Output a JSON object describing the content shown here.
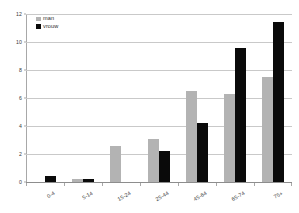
{
  "chart_data": {
    "type": "bar",
    "title": "",
    "subtitle": "",
    "xlabel": "",
    "ylabel": "",
    "categories": [
      "0-4",
      "5-14",
      "15-24",
      "25-44",
      "45-64",
      "65-74",
      "75+"
    ],
    "series": [
      {
        "name": "man",
        "color": "#b3b3b3",
        "values": [
          0,
          0.2,
          2.6,
          3.1,
          6.5,
          6.3,
          7.5
        ]
      },
      {
        "name": "vrouw",
        "color": "#0a0a0a",
        "values": [
          0.4,
          0.2,
          0,
          2.2,
          4.2,
          9.6,
          11.4
        ]
      }
    ],
    "ylim": [
      0,
      12
    ],
    "yticks": [
      0,
      2,
      4,
      6,
      8,
      10,
      12
    ],
    "ytick_labels": [
      "0",
      "2",
      "4",
      "6",
      "8",
      "10",
      "12"
    ],
    "grid": true,
    "grid_axis": "y",
    "legend_position": "top-left",
    "annotations": []
  },
  "legend": {
    "entries": [
      {
        "label": "man"
      },
      {
        "label": "vrouw"
      }
    ]
  },
  "colors": {
    "man": "#b3b3b3",
    "vrouw": "#0a0a0a",
    "gridline": "#c9c9c9",
    "axis": "#a8a8a8",
    "text": "#3a3a3a",
    "background": "#ffffff"
  }
}
